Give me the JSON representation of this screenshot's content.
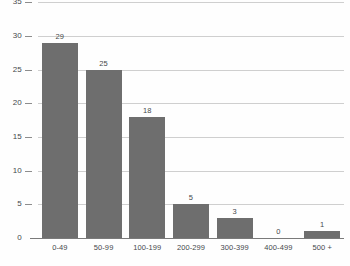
{
  "chart_data": {
    "type": "bar",
    "title": "",
    "subtitle": "",
    "xlabel": "",
    "ylabel": "",
    "categories": [
      "0-49",
      "50-99",
      "100-199",
      "200-299",
      "300-399",
      "400-499",
      "500 +"
    ],
    "values": [
      29,
      25,
      18,
      5,
      3,
      0,
      1
    ],
    "value_labels": [
      "29",
      "25",
      "18",
      "5",
      "3",
      "0",
      "1"
    ],
    "ylim": [
      0,
      35
    ],
    "ytick_values": [
      0,
      5,
      10,
      15,
      20,
      25,
      30,
      35
    ],
    "ytick_labels": [
      "0",
      "5",
      "10",
      "15",
      "20",
      "25",
      "30",
      "35"
    ],
    "grid": true,
    "grid_axis": "y",
    "legend": false,
    "legend_position": "none",
    "orientation": "vertical",
    "bar_color": "#6e6e6e",
    "gridline_color": "#cfcfcf",
    "axis_color": "#7a7a7a",
    "label_color": "#45484c",
    "background_color": "#fefefe",
    "note_top_tick_clipped": "35"
  }
}
